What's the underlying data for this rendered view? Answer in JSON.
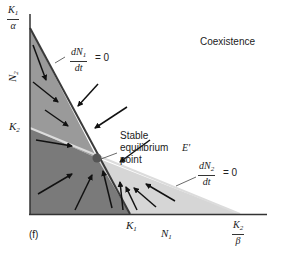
{
  "figure": {
    "panel_label": "(f)",
    "region_label": "Coexistence",
    "x_axis": {
      "label": "N",
      "label_sub": "1"
    },
    "y_axis": {
      "label": "N",
      "label_sub": "2"
    },
    "y_intercepts": {
      "k1_alpha": {
        "num": "K",
        "num_sub": "1",
        "den": "α"
      },
      "k2": {
        "text": "K",
        "sub": "2"
      }
    },
    "x_intercepts": {
      "k1": {
        "text": "K",
        "sub": "1"
      },
      "k2_beta": {
        "num": "K",
        "num_sub": "2",
        "den": "β"
      }
    },
    "isocline_n1": {
      "num": "dN",
      "num_sub": "1",
      "den": "dt",
      "equals": "= 0"
    },
    "isocline_n2": {
      "num": "dN",
      "num_sub": "2",
      "den": "dt",
      "equals": "= 0"
    },
    "equilibrium": {
      "line1": "Stable",
      "line2": "equilibrium",
      "line3": "point",
      "symbol": "E'"
    },
    "colors": {
      "dark_region": "#7a7a7a",
      "mid_region": "#9a9a9a",
      "light_region": "#d6d6d6",
      "k2_line": "#d8d8d8",
      "axis": "#333333",
      "arrow": "#111111",
      "equilibrium_dot": "#555555"
    }
  }
}
